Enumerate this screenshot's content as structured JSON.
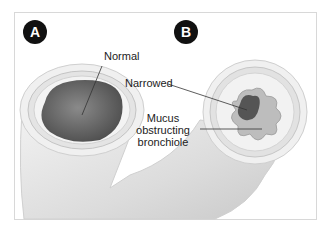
{
  "figure": {
    "panels": [
      {
        "badge": "A",
        "callouts": [
          {
            "text": "Normal"
          }
        ]
      },
      {
        "badge": "B",
        "callouts": [
          {
            "text": "Narrowed"
          },
          {
            "lines": [
              "Mucus",
              "obstructing",
              "bronchiole"
            ]
          }
        ]
      }
    ]
  },
  "colors": {
    "badge_bg": "#111111",
    "tissue_light": "#ececec",
    "lumen_dark": "#6e6e6e",
    "mucus": "#b5b5b5"
  }
}
